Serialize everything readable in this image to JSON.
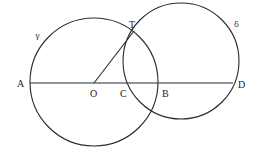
{
  "diagram": {
    "circles": [
      {
        "id": "gamma",
        "label": "γ",
        "cx": 94,
        "cy": 82,
        "r": 64
      },
      {
        "id": "delta",
        "label": "δ",
        "cx": 181,
        "cy": 61,
        "r": 58
      }
    ],
    "segments": [
      {
        "id": "AD",
        "from": "A",
        "to": "D"
      },
      {
        "id": "OT",
        "from": "O",
        "to": "T"
      }
    ],
    "points": {
      "A": {
        "label": "A",
        "x": 30,
        "y": 83
      },
      "O": {
        "label": "O",
        "x": 94,
        "y": 83
      },
      "C": {
        "label": "C",
        "x": 124,
        "y": 83
      },
      "B": {
        "label": "B",
        "x": 158,
        "y": 83
      },
      "D": {
        "label": "D",
        "x": 233,
        "y": 83
      },
      "T": {
        "label": "T",
        "x": 134,
        "y": 31
      }
    },
    "colors": {
      "stroke": "#2a2a2a",
      "background": "#ffffff"
    }
  }
}
